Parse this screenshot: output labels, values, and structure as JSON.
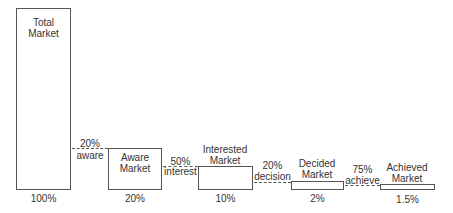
{
  "diagram": {
    "type": "market-funnel",
    "stages": [
      {
        "name_line1": "Total",
        "name_line2": "Market",
        "share": "100%"
      },
      {
        "name_line1": "Aware",
        "name_line2": "Market",
        "share": "20%"
      },
      {
        "name_line1": "Interested",
        "name_line2": "Market",
        "share": "10%"
      },
      {
        "name_line1": "Decided",
        "name_line2": "Market",
        "share": "2%"
      },
      {
        "name_line1": "Achieved",
        "name_line2": "Market",
        "share": "1.5%"
      }
    ],
    "transitions": [
      {
        "rate": "20%",
        "label": "aware"
      },
      {
        "rate": "50%",
        "label": "interest"
      },
      {
        "rate": "20%",
        "label": "decision"
      },
      {
        "rate": "75%",
        "label": "achieve"
      }
    ]
  }
}
